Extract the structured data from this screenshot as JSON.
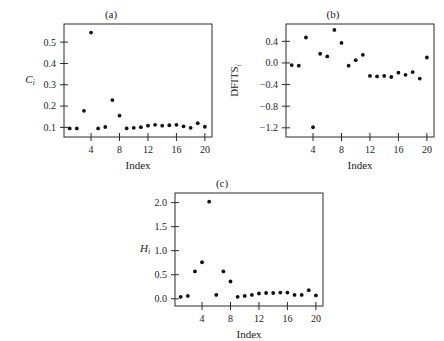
{
  "figure": {
    "background": "#ffffff",
    "point_color": "#111111",
    "axis_color": "#2b2b2b"
  },
  "chart_data": [
    {
      "type": "scatter",
      "panel": "a",
      "title": "(a)",
      "xlabel": "Index",
      "ylabel": "C",
      "ylabel_sub": "i",
      "x": [
        1,
        2,
        3,
        4,
        5,
        6,
        7,
        8,
        9,
        10,
        11,
        12,
        13,
        14,
        15,
        16,
        17,
        18,
        19,
        20
      ],
      "values": [
        0.095,
        0.095,
        0.178,
        0.545,
        0.095,
        0.102,
        0.228,
        0.155,
        0.095,
        0.098,
        0.101,
        0.108,
        0.112,
        0.108,
        0.11,
        0.112,
        0.105,
        0.098,
        0.12,
        0.103
      ],
      "xlim": [
        0.2,
        21.0
      ],
      "ylim": [
        0.055,
        0.585
      ],
      "xticks": [
        4,
        8,
        12,
        16,
        20
      ],
      "yticks": [
        0.1,
        0.2,
        0.3,
        0.4,
        0.5
      ],
      "ytick_labels": [
        "0.1",
        "0.2",
        "0.3",
        "0.4",
        "0.5"
      ],
      "grid": false,
      "legend": "none"
    },
    {
      "type": "scatter",
      "panel": "b",
      "title": "(b)",
      "xlabel": "Index",
      "ylabel": "DFITS",
      "ylabel_sub": "i",
      "x": [
        1,
        2,
        3,
        4,
        5,
        6,
        7,
        8,
        9,
        10,
        11,
        12,
        13,
        14,
        15,
        16,
        17,
        18,
        19,
        20
      ],
      "values": [
        -0.04,
        -0.05,
        0.47,
        -1.19,
        0.17,
        0.12,
        0.61,
        0.37,
        -0.05,
        0.05,
        0.15,
        -0.24,
        -0.25,
        -0.24,
        -0.26,
        -0.18,
        -0.22,
        -0.17,
        -0.29,
        0.1
      ],
      "xlim": [
        0.2,
        21.0
      ],
      "ylim": [
        -1.37,
        0.72
      ],
      "xticks": [
        4,
        8,
        12,
        16,
        20
      ],
      "yticks": [
        0.4,
        0.0,
        -0.4,
        -0.8,
        -1.2
      ],
      "ytick_labels": [
        "0.4",
        "0.0",
        "−0.4",
        "−0.8",
        "−1.2"
      ],
      "grid": false,
      "legend": "none"
    },
    {
      "type": "scatter",
      "panel": "c",
      "title": "(c)",
      "xlabel": "Index",
      "ylabel": "H",
      "ylabel_sub": "i",
      "x": [
        1,
        2,
        3,
        4,
        5,
        6,
        7,
        8,
        9,
        10,
        11,
        12,
        13,
        14,
        15,
        16,
        17,
        18,
        19,
        20
      ],
      "values": [
        0.04,
        0.06,
        0.57,
        0.76,
        2.02,
        0.08,
        0.57,
        0.36,
        0.04,
        0.06,
        0.08,
        0.11,
        0.12,
        0.12,
        0.13,
        0.13,
        0.08,
        0.08,
        0.18,
        0.07
      ],
      "xlim": [
        0.2,
        21.0
      ],
      "ylim": [
        -0.15,
        2.2
      ],
      "xticks": [
        4,
        8,
        12,
        16,
        20
      ],
      "yticks": [
        0.0,
        0.5,
        1.0,
        1.5,
        2.0
      ],
      "ytick_labels": [
        "0.0",
        "0.5",
        "1.0",
        "1.5",
        "2.0"
      ],
      "grid": false,
      "legend": "none"
    }
  ]
}
